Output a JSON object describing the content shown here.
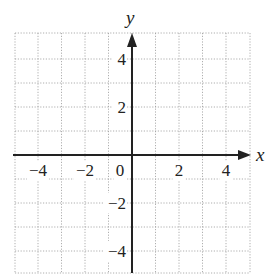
{
  "chart_data": {
    "type": "scatter",
    "title": "",
    "xlabel": "x",
    "ylabel": "y",
    "xlim": [
      -5,
      5
    ],
    "ylim": [
      -5,
      5
    ],
    "grid": true,
    "grid_style": "dotted",
    "grid_step": 1,
    "x_ticks": [
      {
        "value": -4,
        "label": "−4"
      },
      {
        "value": -2,
        "label": "−2"
      },
      {
        "value": 0,
        "label": "0"
      },
      {
        "value": 2,
        "label": "2"
      },
      {
        "value": 4,
        "label": "4"
      }
    ],
    "y_ticks": [
      {
        "value": 4,
        "label": "4"
      },
      {
        "value": 2,
        "label": "2"
      },
      {
        "value": -2,
        "label": "−2"
      },
      {
        "value": -4,
        "label": "−4"
      }
    ],
    "series": [],
    "colors": {
      "axis": "#222222",
      "grid": "#9a9a9a",
      "background": "#ffffff"
    }
  }
}
